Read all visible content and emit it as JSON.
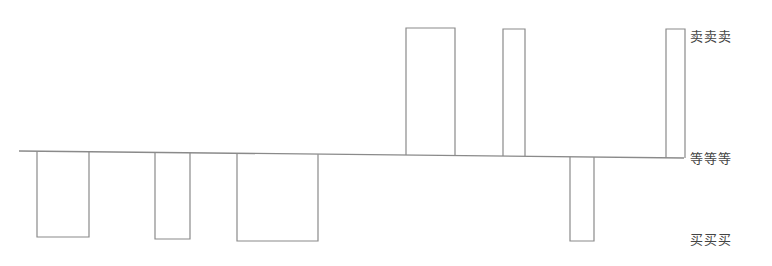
{
  "diagram": {
    "stroke_color": "#8a8a8a",
    "baseline": {
      "x1": 19,
      "y1": 151,
      "x2": 684,
      "y2": 158
    },
    "labels": [
      {
        "id": "sell",
        "text": "卖卖卖",
        "x": 690,
        "y": 26
      },
      {
        "id": "wait",
        "text": "等等等",
        "x": 690,
        "y": 148
      },
      {
        "id": "buy",
        "text": "买买买",
        "x": 690,
        "y": 229
      }
    ],
    "down_bars": [
      {
        "x1": 37,
        "x2": 89,
        "bottom": 237
      },
      {
        "x1": 155,
        "x2": 190,
        "bottom": 239
      },
      {
        "x1": 237,
        "x2": 318,
        "bottom": 241
      },
      {
        "x1": 570,
        "x2": 594,
        "bottom": 241
      }
    ],
    "up_bars": [
      {
        "x1": 406,
        "x2": 455,
        "top": 28
      },
      {
        "x1": 503,
        "x2": 525,
        "top": 29
      },
      {
        "x1": 666,
        "x2": 685,
        "top": 29
      }
    ]
  }
}
